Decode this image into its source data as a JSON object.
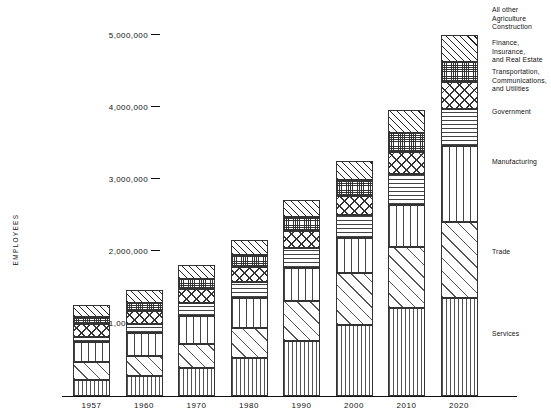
{
  "chart_data": {
    "type": "bar",
    "stacked": true,
    "title": "",
    "xlabel": "",
    "ylabel": "EMPLOYEES",
    "ylim": [
      0,
      5500000
    ],
    "grid": false,
    "legend_position": "right",
    "ytick_labels": [
      "5,000,000",
      "4,000,000",
      "3,000,000",
      "2,000,000",
      "1,000,000"
    ],
    "ytick_values": [
      5000000,
      4000000,
      3000000,
      2000000,
      1000000
    ],
    "categories": [
      "1957",
      "1960",
      "1970",
      "1980",
      "1990",
      "2000",
      "2010",
      "2020"
    ],
    "series": [
      {
        "name": "Services",
        "pattern": "vertical-lines-fine",
        "values": [
          222000,
          278000,
          389000,
          528000,
          764000,
          986000,
          1222000,
          1361000
        ]
      },
      {
        "name": "Trade",
        "pattern": "diagonal-lines-wide",
        "values": [
          250000,
          278000,
          333000,
          417000,
          555000,
          722000,
          847000,
          1056000
        ]
      },
      {
        "name": "Manufacturing",
        "pattern": "vertical-lines-wide",
        "values": [
          278000,
          319000,
          389000,
          417000,
          458000,
          486000,
          583000,
          1056000
        ]
      },
      {
        "name": "Government",
        "pattern": "horizontal-lines",
        "values": [
          69000,
          125000,
          180000,
          222000,
          278000,
          319000,
          430000,
          514000
        ]
      },
      {
        "name": "Transportation, Communications, and Utilities",
        "pattern": "diamond-cross-hatch",
        "values": [
          181000,
          181000,
          195000,
          208000,
          236000,
          264000,
          306000,
          375000
        ]
      },
      {
        "name": "Finance, Insurance, and Real Estate",
        "pattern": "fine-grid",
        "values": [
          97000,
          111000,
          139000,
          167000,
          194000,
          222000,
          264000,
          278000
        ]
      },
      {
        "name": "All other Agriculture Construction",
        "pattern": "diagonal-hatch-steep",
        "values": [
          167000,
          181000,
          195000,
          208000,
          236000,
          264000,
          320000,
          375000
        ]
      }
    ],
    "totals": [
      1264000,
      1473000,
      1820000,
      2167000,
      2721000,
      3263000,
      3972000,
      5015000
    ]
  },
  "legend": {
    "entries": [
      {
        "label": "All other\nAgriculture\nConstruction",
        "key": "all-other"
      },
      {
        "label": "Finance, Insurance,\nand Real Estate",
        "key": "finance"
      },
      {
        "label": "Transportation,\nCommunications,\nand Utilities",
        "key": "transportation"
      },
      {
        "label": "Government",
        "key": "government"
      },
      {
        "label": "Manufacturing",
        "key": "manufacturing"
      },
      {
        "label": "Trade",
        "key": "trade"
      },
      {
        "label": "Services",
        "key": "services"
      }
    ]
  },
  "colors": {
    "ink": "#111111",
    "background": "#ffffff",
    "hatch": "#333333"
  }
}
